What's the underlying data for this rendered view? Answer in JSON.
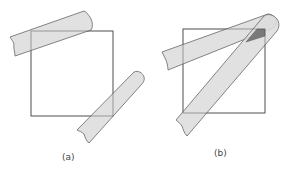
{
  "figure": {
    "panels": [
      {
        "id": "a",
        "label": "(a)",
        "description": "Square with two tape strips overlapping opposite corners"
      },
      {
        "id": "b",
        "label": "(b)",
        "description": "Square with two crossing tape strips; overlap region shaded darker"
      }
    ],
    "colors": {
      "square_stroke": "#555555",
      "tape_fill": "#dcdcdc",
      "tape_stroke": "#666666",
      "overlap_fill": "#7a7a7a",
      "label_color": "#444444"
    }
  }
}
